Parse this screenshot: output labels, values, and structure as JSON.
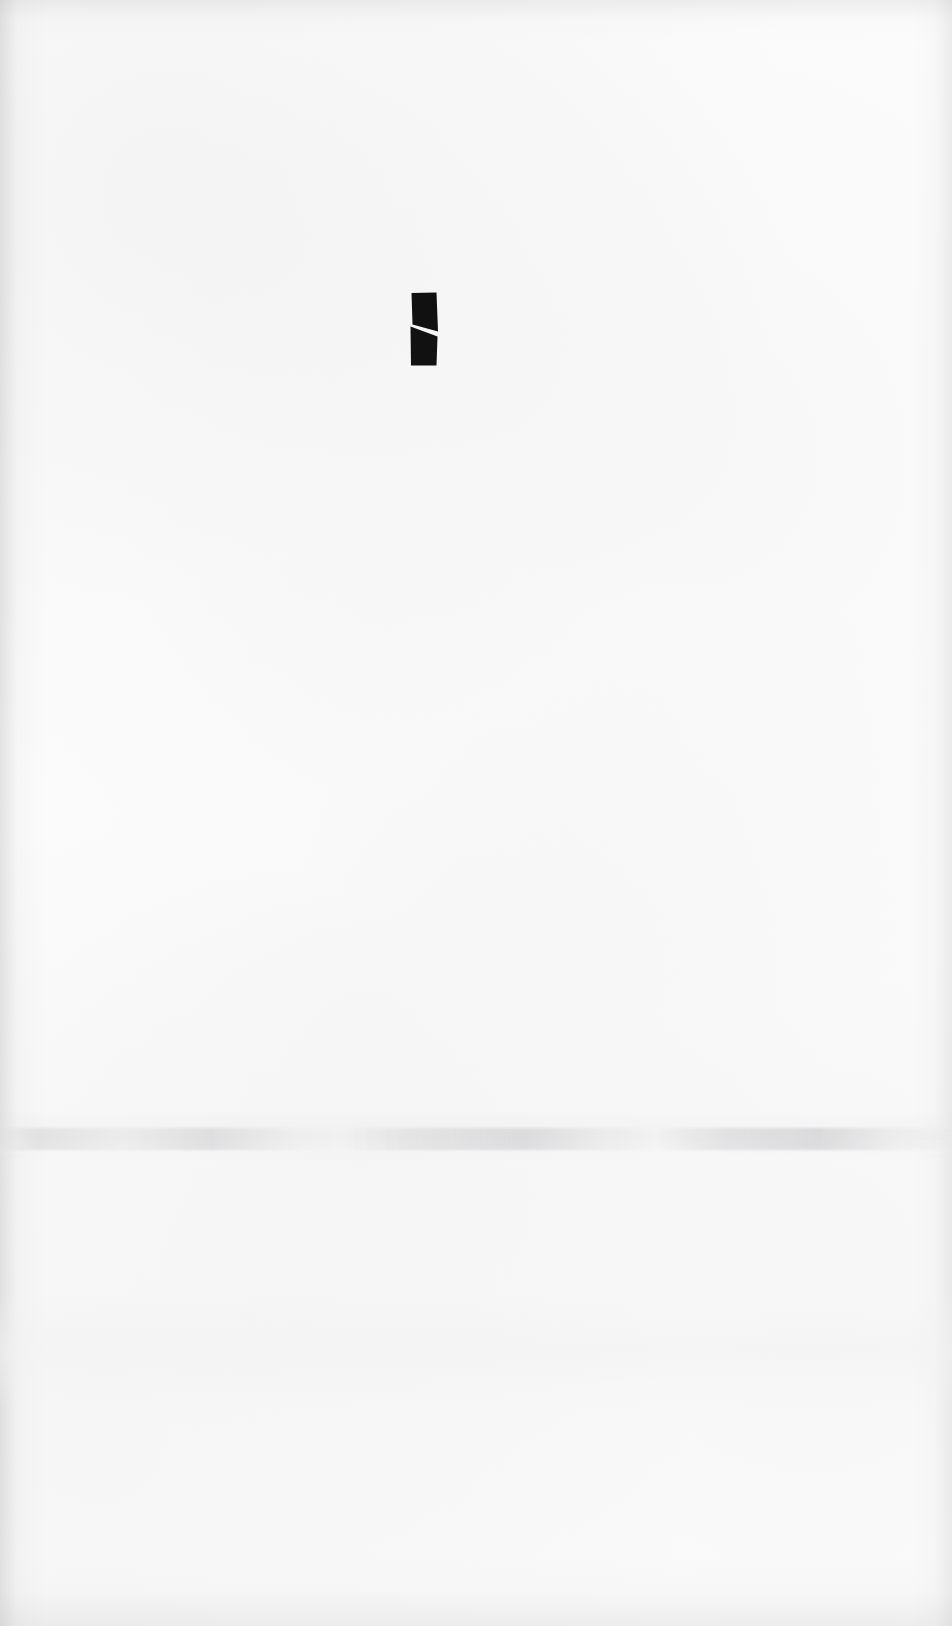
{
  "page": {
    "kind": "scanned-blank-page",
    "width": 952,
    "height": 1626,
    "background_color": "#fcfcfc",
    "visible_text": "",
    "note": ""
  },
  "artifacts": {
    "ink_mark": {
      "name": "ink-mark",
      "description": "small dark rectangular ink glyph with a white diagonal slash through its middle",
      "color": "#111111",
      "slash_color": "#ffffff",
      "x": 408,
      "y": 291,
      "width": 32,
      "height": 76
    },
    "smudge_band": {
      "name": "smudge-band",
      "description": "faint horizontal gray scanner smudge across the page",
      "color": "#c4c4c6",
      "y": 1128,
      "height": 22
    },
    "edge_shading": {
      "name": "edge-shading",
      "description": "subtle gray vignetting along page edges",
      "color": "#a8a8a8"
    }
  }
}
